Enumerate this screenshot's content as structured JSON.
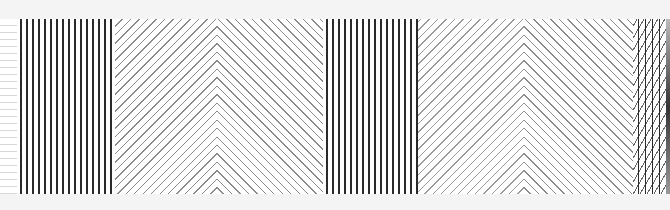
{
  "image": {
    "description": "Photograph of a strip of line-pattern swatches",
    "panels": [
      {
        "pattern": "horizontal-lines",
        "color": "#d8d8d8"
      },
      {
        "pattern": "vertical-lines",
        "color": "#2a2a2a"
      },
      {
        "pattern": "chevron-diagonal",
        "color": "#8a8a8a"
      },
      {
        "pattern": "vertical-lines",
        "color": "#2a2a2a"
      },
      {
        "pattern": "chevron-diagonal",
        "color": "#9a9a9a"
      },
      {
        "pattern": "vertical-diagonal-cross",
        "color": "#2a2a2a"
      }
    ]
  }
}
